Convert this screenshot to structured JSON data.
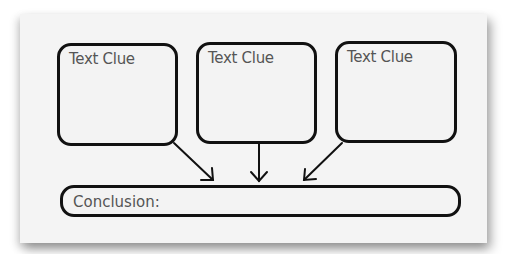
{
  "diagram": {
    "clue_boxes": [
      {
        "label": "Text Clue"
      },
      {
        "label": "Text Clue"
      },
      {
        "label": "Text Clue"
      }
    ],
    "conclusion": {
      "label": "Conclusion:"
    },
    "colors": {
      "stroke": "#111111",
      "text": "#555555",
      "paper": "#f4f4f4"
    }
  }
}
